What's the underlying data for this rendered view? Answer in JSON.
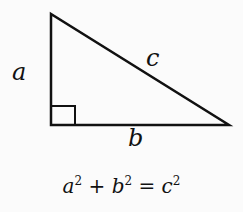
{
  "diagram": {
    "labels": {
      "a": "a",
      "b": "b",
      "c": "c"
    },
    "equation": {
      "a": "a",
      "b": "b",
      "c": "c",
      "exp": "2",
      "plus": " + ",
      "equals": " = "
    },
    "colors": {
      "stroke": "#111111",
      "background": "#fbfbfb"
    }
  }
}
